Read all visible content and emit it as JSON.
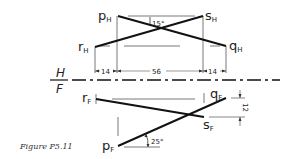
{
  "figure": {
    "caption": "Figure P5.11",
    "reference_line": {
      "upper": "H",
      "lower": "F"
    },
    "top_view": {
      "points": {
        "p": "p",
        "q": "q",
        "r": "r",
        "s": "s"
      },
      "subscript": "H",
      "angle_label": "15°",
      "dimensions": [
        "14",
        "56",
        "14"
      ]
    },
    "front_view": {
      "points": {
        "p": "p",
        "q": "q",
        "r": "r",
        "s": "s"
      },
      "subscript": "F",
      "angle_label": "25°",
      "dimension": "12"
    }
  },
  "colors": {
    "ink": "#1a1a1a",
    "thin": "#555555",
    "background": "#ffffff"
  }
}
